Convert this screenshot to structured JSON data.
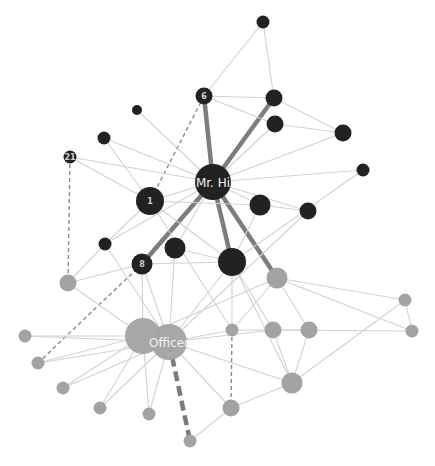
{
  "graph": {
    "title": "Zachary karate club network",
    "colors": {
      "group_mr_hi": "#222222",
      "group_officer": "#a3a3a3",
      "edge": "#d2d2d2",
      "edge_strong": "#7d7d7d"
    },
    "nodes": [
      {
        "id": "mrhi",
        "label": "Mr. Hi",
        "group": "mr_hi",
        "size": "xl"
      },
      {
        "id": "n6",
        "label": "6",
        "group": "mr_hi",
        "size": "s"
      },
      {
        "id": "ntop",
        "label": "",
        "group": "mr_hi",
        "size": "xs"
      },
      {
        "id": "na",
        "label": "",
        "group": "mr_hi",
        "size": "s"
      },
      {
        "id": "nb",
        "label": "",
        "group": "mr_hi",
        "size": "s"
      },
      {
        "id": "nc",
        "label": "",
        "group": "mr_hi",
        "size": "s"
      },
      {
        "id": "nd",
        "label": "",
        "group": "mr_hi",
        "size": "xs"
      },
      {
        "id": "n1",
        "label": "1",
        "group": "mr_hi",
        "size": "l"
      },
      {
        "id": "n21",
        "label": "21",
        "group": "mr_hi",
        "size": "xs"
      },
      {
        "id": "ne",
        "label": "",
        "group": "mr_hi",
        "size": "xxs"
      },
      {
        "id": "nf",
        "label": "",
        "group": "mr_hi",
        "size": "xs"
      },
      {
        "id": "ng",
        "label": "",
        "group": "mr_hi",
        "size": "m"
      },
      {
        "id": "nh",
        "label": "",
        "group": "mr_hi",
        "size": "s"
      },
      {
        "id": "ni",
        "label": "",
        "group": "mr_hi",
        "size": "xs"
      },
      {
        "id": "n8",
        "label": "8",
        "group": "mr_hi",
        "size": "m"
      },
      {
        "id": "nj",
        "label": "",
        "group": "mr_hi",
        "size": "m"
      },
      {
        "id": "nk",
        "label": "",
        "group": "mr_hi",
        "size": "l"
      },
      {
        "id": "g1",
        "label": "",
        "group": "officer",
        "size": "m"
      },
      {
        "id": "g2",
        "label": "",
        "group": "officer",
        "size": "s"
      },
      {
        "id": "g3",
        "label": "",
        "group": "officer",
        "size": "xl"
      },
      {
        "id": "officer",
        "label": "Officer",
        "group": "officer",
        "size": "xl"
      },
      {
        "id": "g4",
        "label": "",
        "group": "officer",
        "size": "xs"
      },
      {
        "id": "g5",
        "label": "",
        "group": "officer",
        "size": "xs"
      },
      {
        "id": "g6",
        "label": "",
        "group": "officer",
        "size": "xs"
      },
      {
        "id": "g7",
        "label": "",
        "group": "officer",
        "size": "xs"
      },
      {
        "id": "g8",
        "label": "",
        "group": "officer",
        "size": "xs"
      },
      {
        "id": "g9",
        "label": "",
        "group": "officer",
        "size": "xs"
      },
      {
        "id": "g10",
        "label": "",
        "group": "officer",
        "size": "s"
      },
      {
        "id": "g11",
        "label": "",
        "group": "officer",
        "size": "m"
      },
      {
        "id": "g12",
        "label": "",
        "group": "officer",
        "size": "xs"
      },
      {
        "id": "g13",
        "label": "",
        "group": "officer",
        "size": "s"
      },
      {
        "id": "g14",
        "label": "",
        "group": "officer",
        "size": "s"
      },
      {
        "id": "g15",
        "label": "",
        "group": "officer",
        "size": "xs"
      },
      {
        "id": "g16",
        "label": "",
        "group": "officer",
        "size": "xs"
      }
    ],
    "edges": [
      {
        "source": "mrhi",
        "target": "n6",
        "style": "strong"
      },
      {
        "source": "mrhi",
        "target": "na",
        "style": "strong"
      },
      {
        "source": "mrhi",
        "target": "n8",
        "style": "strong"
      },
      {
        "source": "mrhi",
        "target": "nk",
        "style": "strong"
      },
      {
        "source": "mrhi",
        "target": "g1",
        "style": "strong"
      },
      {
        "source": "n6",
        "target": "n1",
        "style": "dashed"
      },
      {
        "source": "n21",
        "target": "g1x",
        "style": "dashed"
      },
      {
        "source": "n8",
        "target": "g5",
        "style": "dashed"
      },
      {
        "source": "g12",
        "target": "g10",
        "style": "dashed"
      },
      {
        "source": "officer",
        "target": "g9",
        "style": "dashed-strong"
      },
      {
        "source": "ntop",
        "target": "n6",
        "style": "normal"
      },
      {
        "source": "ntop",
        "target": "na",
        "style": "normal"
      },
      {
        "source": "n6",
        "target": "na",
        "style": "normal"
      },
      {
        "source": "n6",
        "target": "nb",
        "style": "normal"
      },
      {
        "source": "na",
        "target": "nc",
        "style": "normal"
      },
      {
        "source": "nb",
        "target": "nc",
        "style": "normal"
      },
      {
        "source": "nb",
        "target": "mrhi",
        "style": "normal"
      },
      {
        "source": "nc",
        "target": "mrhi",
        "style": "normal"
      },
      {
        "source": "nd",
        "target": "mrhi",
        "style": "normal"
      },
      {
        "source": "nd",
        "target": "nk",
        "style": "normal"
      },
      {
        "source": "ne",
        "target": "mrhi",
        "style": "normal"
      },
      {
        "source": "nf",
        "target": "mrhi",
        "style": "normal"
      },
      {
        "source": "nf",
        "target": "n1",
        "style": "normal"
      },
      {
        "source": "n21",
        "target": "mrhi",
        "style": "normal"
      },
      {
        "source": "n21",
        "target": "n1",
        "style": "normal"
      },
      {
        "source": "n1",
        "target": "mrhi",
        "style": "normal"
      },
      {
        "source": "n1",
        "target": "ng",
        "style": "normal"
      },
      {
        "source": "n1",
        "target": "ni",
        "style": "normal"
      },
      {
        "source": "n1",
        "target": "nk",
        "style": "normal"
      },
      {
        "source": "n1",
        "target": "g12a",
        "style": "normal"
      },
      {
        "source": "mrhi",
        "target": "ng",
        "style": "normal"
      },
      {
        "source": "mrhi",
        "target": "nh",
        "style": "normal"
      },
      {
        "source": "mrhi",
        "target": "nj",
        "style": "normal"
      },
      {
        "source": "mrhi",
        "target": "ni",
        "style": "normal"
      },
      {
        "source": "ng",
        "target": "nh",
        "style": "normal"
      },
      {
        "source": "ng",
        "target": "nk",
        "style": "normal"
      },
      {
        "source": "nh",
        "target": "officer",
        "style": "normal"
      },
      {
        "source": "ni",
        "target": "g1x",
        "style": "normal"
      },
      {
        "source": "ni",
        "target": "officer",
        "style": "normal"
      },
      {
        "source": "n8",
        "target": "nk",
        "style": "normal"
      },
      {
        "source": "n8",
        "target": "g1x",
        "style": "normal"
      },
      {
        "source": "n8",
        "target": "g3",
        "style": "normal"
      },
      {
        "source": "n8",
        "target": "officer",
        "style": "normal"
      },
      {
        "source": "nj",
        "target": "officer",
        "style": "normal"
      },
      {
        "source": "nj",
        "target": "nk",
        "style": "normal"
      },
      {
        "source": "nk",
        "target": "officer",
        "style": "normal"
      },
      {
        "source": "nk",
        "target": "g11",
        "style": "normal"
      },
      {
        "source": "nk",
        "target": "g12",
        "style": "normal"
      },
      {
        "source": "nk",
        "target": "g13",
        "style": "normal"
      },
      {
        "source": "g1",
        "target": "g3",
        "style": "normal"
      },
      {
        "source": "g1",
        "target": "g12",
        "style": "normal"
      },
      {
        "source": "g1",
        "target": "g14",
        "style": "normal"
      },
      {
        "source": "g1",
        "target": "g15",
        "style": "normal"
      },
      {
        "source": "g1",
        "target": "g16",
        "style": "normal"
      },
      {
        "source": "g1x",
        "target": "g3",
        "style": "normal"
      },
      {
        "source": "g3",
        "target": "g4",
        "style": "normal"
      },
      {
        "source": "g3",
        "target": "g5",
        "style": "normal"
      },
      {
        "source": "g3",
        "target": "g6",
        "style": "normal"
      },
      {
        "source": "g3",
        "target": "g7",
        "style": "normal"
      },
      {
        "source": "g3",
        "target": "g8",
        "style": "normal"
      },
      {
        "source": "officer",
        "target": "g4",
        "style": "normal"
      },
      {
        "source": "officer",
        "target": "g5",
        "style": "normal"
      },
      {
        "source": "officer",
        "target": "g6",
        "style": "normal"
      },
      {
        "source": "officer",
        "target": "g7",
        "style": "normal"
      },
      {
        "source": "officer",
        "target": "g8",
        "style": "normal"
      },
      {
        "source": "officer",
        "target": "g10",
        "style": "normal"
      },
      {
        "source": "officer",
        "target": "g11",
        "style": "normal"
      },
      {
        "source": "officer",
        "target": "g12",
        "style": "normal"
      },
      {
        "source": "officer",
        "target": "g13",
        "style": "normal"
      },
      {
        "source": "g12",
        "target": "g13",
        "style": "normal"
      },
      {
        "source": "g13",
        "target": "g14",
        "style": "normal"
      },
      {
        "source": "g13",
        "target": "g16",
        "style": "normal"
      },
      {
        "source": "g13",
        "target": "g11",
        "style": "normal"
      },
      {
        "source": "g14",
        "target": "g11",
        "style": "normal"
      },
      {
        "source": "g15",
        "target": "g16",
        "style": "normal"
      },
      {
        "source": "g15",
        "target": "g11",
        "style": "normal"
      },
      {
        "source": "g11",
        "target": "g10",
        "style": "normal"
      },
      {
        "source": "g10",
        "target": "g9",
        "style": "normal"
      }
    ]
  }
}
